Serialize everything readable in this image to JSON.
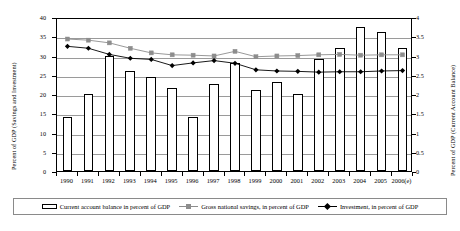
{
  "chart_data": {
    "type": "bar",
    "title": "",
    "xlabel": "",
    "ylabel": "Percent of GDP (Savings and Investment)",
    "y2label": "Percent of GDP (Current Account Balance)",
    "categories": [
      "1990",
      "1991",
      "1992",
      "1993",
      "1994",
      "1995",
      "1996",
      "1997",
      "1998",
      "1999",
      "2000",
      "2001",
      "2002",
      "2003",
      "2004",
      "2005",
      "2006(e)"
    ],
    "ylim": [
      0,
      40
    ],
    "yticks": [
      0,
      5,
      10,
      15,
      20,
      25,
      30,
      35,
      40
    ],
    "y2lim": [
      0,
      4
    ],
    "y2ticks": [
      0,
      0.5,
      1,
      1.5,
      2,
      2.5,
      3,
      3.5,
      4
    ],
    "grid": true,
    "legend_position": "bottom",
    "series": [
      {
        "name": "Current account balance in percent of GDP",
        "type": "bar",
        "axis": "right",
        "color": "#ffffff",
        "edge_color": "#000000",
        "values": [
          1.4,
          2.0,
          3.0,
          2.6,
          2.45,
          2.15,
          1.4,
          2.25,
          2.8,
          2.1,
          2.3,
          2.0,
          2.9,
          3.2,
          3.75,
          3.6,
          3.2
        ]
      },
      {
        "name": "Gross national savings, in percent of GDP",
        "type": "line",
        "axis": "left",
        "color": "#8d8d8d",
        "marker": "square",
        "values": [
          34.8,
          34.5,
          33.8,
          32.4,
          31.2,
          30.7,
          30.6,
          30.4,
          31.6,
          30.2,
          30.4,
          30.5,
          30.7,
          30.8,
          30.6,
          30.7,
          30.7
        ]
      },
      {
        "name": "Investment, in percent of GDP",
        "type": "line",
        "axis": "left",
        "color": "#000000",
        "marker": "diamond",
        "values": [
          32.9,
          32.4,
          30.8,
          29.8,
          29.5,
          27.9,
          28.6,
          29.2,
          28.5,
          26.8,
          26.5,
          26.4,
          26.2,
          26.3,
          26.3,
          26.5,
          26.6
        ]
      }
    ]
  },
  "axes": {
    "left_title": "Percent of GDP (Savings and Investment)",
    "right_title": "Percent of GDP (Current Account Balance)",
    "left_ticks": [
      "0",
      "5",
      "10",
      "15",
      "20",
      "25",
      "30",
      "35",
      "40"
    ],
    "right_ticks": [
      "0",
      "0.5",
      "1",
      "1.5",
      "2",
      "2.5",
      "3",
      "3.5",
      "4"
    ],
    "x_ticks": [
      "1990",
      "1991",
      "1992",
      "1993",
      "1994",
      "1995",
      "1996",
      "1997",
      "1998",
      "1999",
      "2000",
      "2001",
      "2002",
      "2003",
      "2004",
      "2005",
      "2006(e)"
    ]
  },
  "legend": {
    "items": [
      {
        "label": "Current account balance in percent of GDP",
        "marker": "bar-swatch"
      },
      {
        "label": "Gross national savings, in percent of GDP",
        "marker": "square-line-marker"
      },
      {
        "label": "Investment, in percent of GDP",
        "marker": "diamond-line-marker"
      }
    ]
  }
}
